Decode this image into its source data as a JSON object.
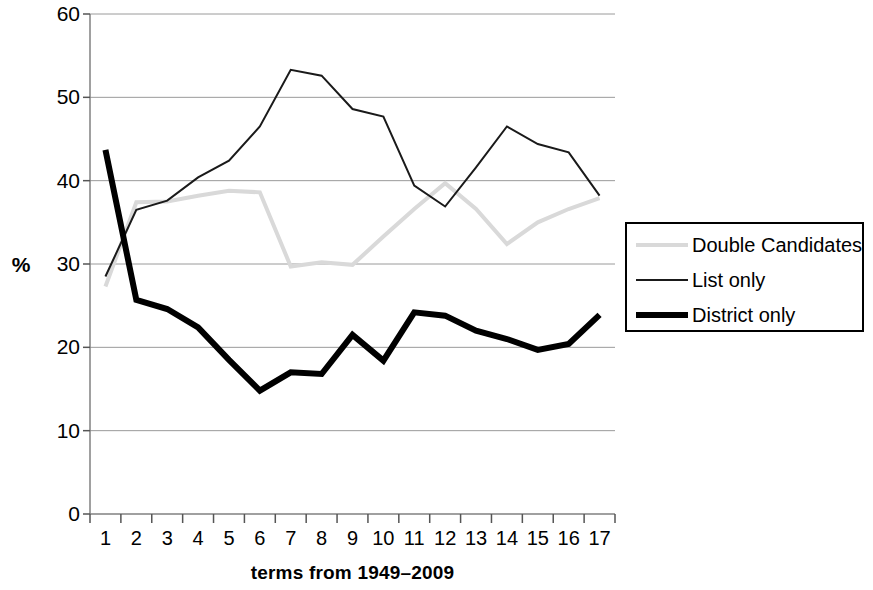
{
  "chart_data": {
    "type": "line",
    "title": "",
    "xlabel": "terms from 1949–2009",
    "ylabel": "%",
    "categories": [
      "1",
      "2",
      "3",
      "4",
      "5",
      "6",
      "7",
      "8",
      "9",
      "10",
      "11",
      "12",
      "13",
      "14",
      "15",
      "16",
      "17"
    ],
    "xlim": [
      1,
      17
    ],
    "ylim": [
      0,
      60
    ],
    "ytick_labels": [
      "0",
      "10",
      "20",
      "30",
      "40",
      "50",
      "60"
    ],
    "ytick_values": [
      0,
      10,
      20,
      30,
      40,
      50,
      60
    ],
    "grid": "horizontal",
    "legend_position": "right",
    "series": [
      {
        "name": "Double Candidates",
        "color": "#d9d9d9",
        "width": 4,
        "values": [
          27.3,
          37.4,
          37.5,
          38.2,
          38.8,
          38.6,
          29.7,
          30.2,
          29.9,
          33.3,
          36.6,
          39.7,
          36.6,
          32.4,
          35.0,
          36.6,
          37.9
        ]
      },
      {
        "name": "List only",
        "color": "#1a1a1a",
        "width": 2,
        "values": [
          28.5,
          36.5,
          37.6,
          40.4,
          42.4,
          46.5,
          53.3,
          52.6,
          48.6,
          47.7,
          39.4,
          36.9,
          41.6,
          46.5,
          44.4,
          43.4,
          38.2
        ]
      },
      {
        "name": "District only",
        "color": "#000000",
        "width": 6,
        "values": [
          43.7,
          25.7,
          24.6,
          22.4,
          18.5,
          14.8,
          17.0,
          16.8,
          21.5,
          18.4,
          24.2,
          23.8,
          22.0,
          21.0,
          19.7,
          20.4,
          23.9
        ]
      }
    ]
  },
  "legend": {
    "items": [
      {
        "label": "Double Candidates",
        "style": "double"
      },
      {
        "label": "List only",
        "style": "list"
      },
      {
        "label": "District only",
        "style": "district"
      }
    ]
  }
}
